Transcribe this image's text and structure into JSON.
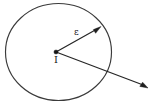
{
  "figure": {
    "background_color": "#ffffff",
    "ink_color": "#262626",
    "labels": {
      "angle_label": "ε",
      "vertex_label": "I"
    },
    "geometry": {
      "circle": {
        "center_x": 58,
        "center_y": 52,
        "radius": 53,
        "stroke_width": 1.15
      },
      "vertex": {
        "x": 56,
        "y": 52,
        "dot_radius": 2.1
      },
      "rays": [
        {
          "name": "short-ray",
          "from_x": 56,
          "from_y": 52,
          "to_x": 100,
          "to_y": 27,
          "has_arrowhead": true,
          "label": "ε"
        },
        {
          "name": "long-ray",
          "from_x": 56,
          "from_y": 52,
          "to_x": 148,
          "to_y": 88,
          "has_arrowhead": true,
          "label": ""
        }
      ]
    }
  }
}
